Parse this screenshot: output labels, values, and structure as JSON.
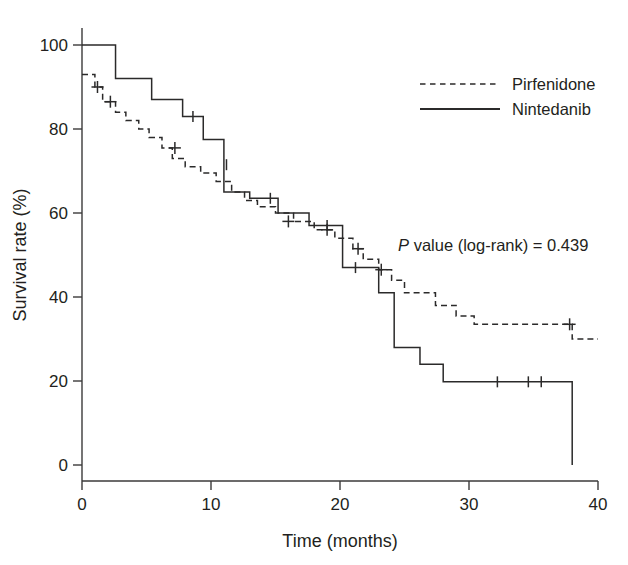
{
  "chart_data": {
    "type": "line",
    "title": "",
    "subtitle": "",
    "xlabel": "Time (months)",
    "ylabel": "Survival rate (%)",
    "xlim": [
      0,
      40
    ],
    "ylim": [
      0,
      100
    ],
    "xticks": [
      0,
      10,
      20,
      30,
      40
    ],
    "yticks": [
      0,
      20,
      40,
      60,
      80,
      100
    ],
    "xtick_labels": [
      "0",
      "10",
      "20",
      "30",
      "40"
    ],
    "ytick_labels": [
      "0",
      "20",
      "40",
      "60",
      "80",
      "100"
    ],
    "grid": false,
    "legend_position": "top-right",
    "annotations": [
      {
        "name": "p-value",
        "text_italic": "P",
        "text": " value (log-rank) = 0.439",
        "full_text": "P value (log-rank) = 0.439",
        "x": 24.5,
        "y": 51
      }
    ],
    "series": [
      {
        "name": "Pirfenidone",
        "style": "dashed",
        "color": "#2b2a2a",
        "step": "post",
        "points": [
          [
            0.0,
            93.0
          ],
          [
            1.0,
            93.0
          ],
          [
            1.0,
            90.0
          ],
          [
            1.6,
            90.0
          ],
          [
            1.6,
            86.5
          ],
          [
            2.6,
            86.5
          ],
          [
            2.6,
            84.0
          ],
          [
            3.4,
            84.0
          ],
          [
            3.4,
            82.0
          ],
          [
            4.4,
            82.0
          ],
          [
            4.4,
            80.0
          ],
          [
            5.2,
            80.0
          ],
          [
            5.2,
            78.0
          ],
          [
            6.2,
            78.0
          ],
          [
            6.2,
            75.5
          ],
          [
            7.0,
            75.5
          ],
          [
            7.0,
            73.0
          ],
          [
            8.0,
            73.0
          ],
          [
            8.0,
            71.0
          ],
          [
            9.2,
            71.0
          ],
          [
            9.2,
            69.5
          ],
          [
            10.4,
            69.5
          ],
          [
            10.4,
            67.5
          ],
          [
            11.6,
            67.5
          ],
          [
            11.6,
            65.0
          ],
          [
            12.6,
            65.0
          ],
          [
            12.6,
            63.0
          ],
          [
            13.6,
            63.0
          ],
          [
            13.6,
            61.5
          ],
          [
            15.0,
            61.5
          ],
          [
            15.0,
            60.0
          ],
          [
            16.4,
            60.0
          ],
          [
            16.4,
            58.0
          ],
          [
            18.0,
            58.0
          ],
          [
            18.0,
            56.0
          ],
          [
            19.6,
            56.0
          ],
          [
            19.6,
            54.0
          ],
          [
            21.0,
            54.0
          ],
          [
            21.0,
            51.5
          ],
          [
            21.8,
            51.5
          ],
          [
            21.8,
            49.0
          ],
          [
            23.0,
            49.0
          ],
          [
            23.0,
            46.5
          ],
          [
            24.0,
            46.5
          ],
          [
            24.0,
            44.0
          ],
          [
            25.0,
            44.0
          ],
          [
            25.0,
            41.0
          ],
          [
            27.4,
            41.0
          ],
          [
            27.4,
            38.0
          ],
          [
            29.0,
            38.0
          ],
          [
            29.0,
            35.5
          ],
          [
            30.4,
            35.5
          ],
          [
            30.4,
            33.5
          ],
          [
            38.0,
            33.5
          ],
          [
            38.0,
            30.0
          ],
          [
            40.0,
            30.0
          ]
        ],
        "censored": [
          [
            1.2,
            90.0
          ],
          [
            2.2,
            86.5
          ],
          [
            7.2,
            75.5
          ],
          [
            16.0,
            58.0
          ],
          [
            19.0,
            56.0
          ],
          [
            21.4,
            51.5
          ],
          [
            23.2,
            46.5
          ],
          [
            37.8,
            33.5
          ]
        ]
      },
      {
        "name": "Nintedanib",
        "style": "solid",
        "color": "#2b2a2a",
        "step": "post",
        "points": [
          [
            0.0,
            100.0
          ],
          [
            2.6,
            100.0
          ],
          [
            2.6,
            92.0
          ],
          [
            5.4,
            92.0
          ],
          [
            5.4,
            87.0
          ],
          [
            7.8,
            87.0
          ],
          [
            7.8,
            83.0
          ],
          [
            9.4,
            83.0
          ],
          [
            9.4,
            77.5
          ],
          [
            11.0,
            77.5
          ],
          [
            11.0,
            65.0
          ],
          [
            13.0,
            65.0
          ],
          [
            13.0,
            63.5
          ],
          [
            15.2,
            63.5
          ],
          [
            15.2,
            60.0
          ],
          [
            17.6,
            60.0
          ],
          [
            17.6,
            57.0
          ],
          [
            20.2,
            57.0
          ],
          [
            20.2,
            47.0
          ],
          [
            23.0,
            47.0
          ],
          [
            23.0,
            41.0
          ],
          [
            24.2,
            41.0
          ],
          [
            24.2,
            28.0
          ],
          [
            26.2,
            28.0
          ],
          [
            26.2,
            24.0
          ],
          [
            28.0,
            24.0
          ],
          [
            28.0,
            19.8
          ],
          [
            38.0,
            19.8
          ],
          [
            38.0,
            0.0
          ]
        ],
        "censored": [
          [
            8.6,
            83.0
          ],
          [
            11.2,
            71.5
          ],
          [
            14.6,
            63.5
          ],
          [
            19.0,
            57.0
          ],
          [
            21.2,
            47.0
          ],
          [
            32.2,
            19.8
          ],
          [
            34.6,
            19.8
          ],
          [
            35.6,
            19.8
          ]
        ]
      }
    ]
  },
  "legend": {
    "items": [
      {
        "label": "Pirfenidone",
        "style": "dashed"
      },
      {
        "label": "Nintedanib",
        "style": "solid"
      }
    ]
  },
  "axes": {
    "x_title": "Time (months)",
    "y_title": "Survival rate (%)"
  }
}
